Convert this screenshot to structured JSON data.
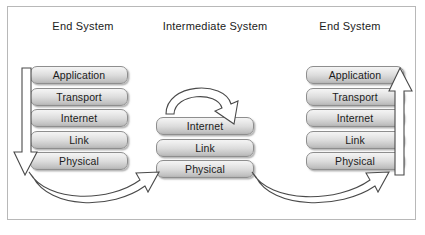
{
  "diagram": {
    "columns": [
      {
        "id": "left",
        "heading": "End System"
      },
      {
        "id": "mid",
        "heading": "Intermediate System"
      },
      {
        "id": "right",
        "heading": "End System"
      }
    ],
    "stacks": {
      "left": {
        "layers": [
          "Application",
          "Transport",
          "Internet",
          "Link",
          "Physical"
        ]
      },
      "mid": {
        "layers": [
          "Internet",
          "Link",
          "Physical"
        ]
      },
      "right": {
        "layers": [
          "Application",
          "Transport",
          "Internet",
          "Link",
          "Physical"
        ]
      }
    },
    "arrows": [
      {
        "name": "left-stack-descend-arrow",
        "direction": "down",
        "from": "Application",
        "to": "Physical"
      },
      {
        "name": "left-to-middle-link-arrow",
        "direction": "right",
        "from": "left Physical",
        "to": "middle Physical"
      },
      {
        "name": "middle-relay-arch-arrow",
        "direction": "down",
        "from": "relay",
        "to": "middle Internet"
      },
      {
        "name": "middle-to-right-link-arrow",
        "direction": "right",
        "from": "middle Physical",
        "to": "right Physical"
      },
      {
        "name": "right-stack-ascend-arrow",
        "direction": "up",
        "from": "Physical",
        "to": "Application"
      }
    ],
    "colors": {
      "box_fill_top": "#f4f4f4",
      "box_fill_bottom": "#b4b4b4",
      "box_border": "#8e8e8e",
      "arrow_fill": "#ffffff",
      "arrow_stroke": "#4a4a4a",
      "frame_border": "#b8b8b8",
      "background": "#ffffff",
      "text": "#1b1b1b"
    }
  }
}
